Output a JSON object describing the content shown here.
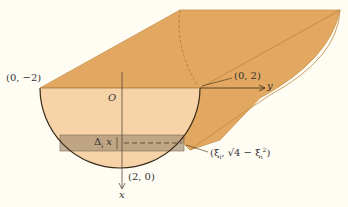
{
  "diagram": {
    "type": "solid-of-known-cross-section",
    "colors": {
      "background": "#fffcf3",
      "solid_body": "#e2a760",
      "solid_edge": "#b98440",
      "cross_section": "#f6d4a8",
      "slab": "#b5a38a",
      "outline": "#3a2a18",
      "text": "#333333"
    },
    "labels": {
      "point_left": "(0, −2)",
      "origin": "O",
      "point_right": "(0, 2)",
      "y_axis": "y",
      "point_bottom": "(2, 0)",
      "x_axis": "x",
      "slab_thickness": "Δ",
      "slab_thickness_sub": "i",
      "slab_thickness_var": "x",
      "sample_point_open": "(ξ",
      "sample_point_sub": "i",
      "sample_point_mid": ", √4 − ξ",
      "sample_point_sub2": "i",
      "sample_point_sup": "2",
      "sample_point_close": ")"
    }
  }
}
